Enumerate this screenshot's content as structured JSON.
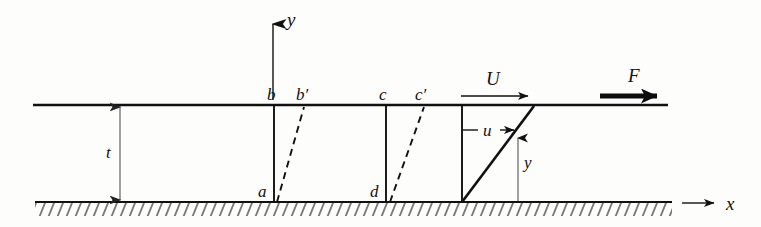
{
  "figure": {
    "caption": "",
    "background_color": "#fdfdfc",
    "ink_color": "#111111"
  },
  "axes": {
    "y_axis": {
      "label": "y",
      "x": 273,
      "y_top": 18,
      "y_bottom": 100
    },
    "x_axis": {
      "label": "x",
      "y": 203,
      "x_start": 682,
      "x_end": 720
    }
  },
  "geometry": {
    "top_plate": {
      "y": 105,
      "x_start": 33,
      "x_end": 668
    },
    "bottom_wall": {
      "y": 202,
      "x_start": 35,
      "x_end": 672
    },
    "gap_label": "t",
    "gap_dimension": {
      "x": 120,
      "y_top": 107,
      "y_bottom": 200
    }
  },
  "fluid_elements": [
    {
      "name": "element-ab",
      "top_label": "b",
      "top_prime_label": "b′",
      "bottom_label": "a",
      "x_vertical": 274,
      "x_deformed_top": 304
    },
    {
      "name": "element-cd",
      "top_label": "c",
      "top_prime_label": "c′",
      "bottom_label": "d",
      "x_vertical": 386,
      "x_deformed_top": 424
    }
  ],
  "velocity": {
    "plate_velocity_label": "U",
    "plate_velocity_arrow": {
      "x_start": 461,
      "x_end": 534,
      "y": 96
    },
    "local_velocity_label": "u",
    "local_velocity_arrow": {
      "x_start": 463,
      "x_end": 519,
      "y": 130
    },
    "height_label": "y",
    "height_dimension": {
      "x": 518,
      "y_top": 134,
      "y_bottom": 201
    },
    "profile": {
      "x_base": 462,
      "y_base": 202,
      "x_tip": 534,
      "y_tip": 106
    }
  },
  "force": {
    "label": "F",
    "arrow": {
      "x_start": 600,
      "x_end": 672,
      "y": 96
    }
  },
  "labels": {
    "b": "b",
    "b_prime": "b′",
    "a": "a",
    "c": "c",
    "c_prime": "c′",
    "d": "d",
    "t": "t",
    "U": "U",
    "u": "u",
    "y_axis": "y",
    "y_height": "y",
    "x_axis": "x",
    "F": "F"
  }
}
